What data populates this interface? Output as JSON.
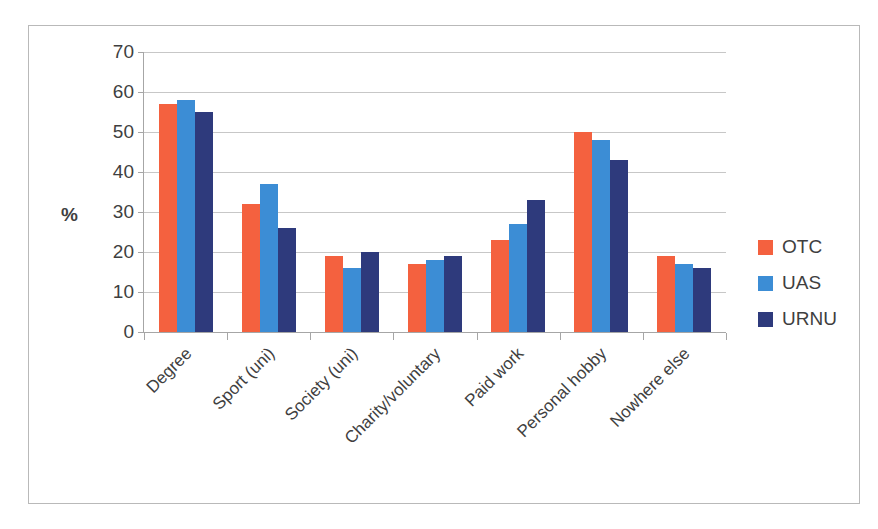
{
  "chart_data": {
    "type": "bar",
    "title": "",
    "subtitle": "",
    "xlabel": "",
    "ylabel": "%",
    "ylim": [
      0,
      70
    ],
    "ytick_step": 10,
    "yticks": [
      0,
      10,
      20,
      30,
      40,
      50,
      60,
      70
    ],
    "ytick_labels": [
      "0",
      "10",
      "20",
      "30",
      "40",
      "50",
      "60",
      "70"
    ],
    "grid": true,
    "grid_axis": "y",
    "legend_position": "right",
    "categories": [
      "Degree",
      "Sport (uni)",
      "Society (uni)",
      "Charity/voluntary",
      "Paid work",
      "Personal hobby",
      "Nowhere else"
    ],
    "series": [
      {
        "name": "OTC",
        "color": "#f4613f",
        "values": [
          57,
          32,
          19,
          17,
          23,
          50,
          19
        ]
      },
      {
        "name": "UAS",
        "color": "#3c8dd5",
        "values": [
          58,
          37,
          16,
          18,
          27,
          48,
          17
        ]
      },
      {
        "name": "URNU",
        "color": "#2e3a7c",
        "values": [
          55,
          26,
          20,
          19,
          33,
          43,
          16
        ]
      }
    ]
  },
  "legend": {
    "items": [
      {
        "label": "OTC",
        "color": "#f4613f"
      },
      {
        "label": "UAS",
        "color": "#3c8dd5"
      },
      {
        "label": "URNU",
        "color": "#2e3a7c"
      }
    ]
  },
  "axis": {
    "y_label": "%"
  }
}
